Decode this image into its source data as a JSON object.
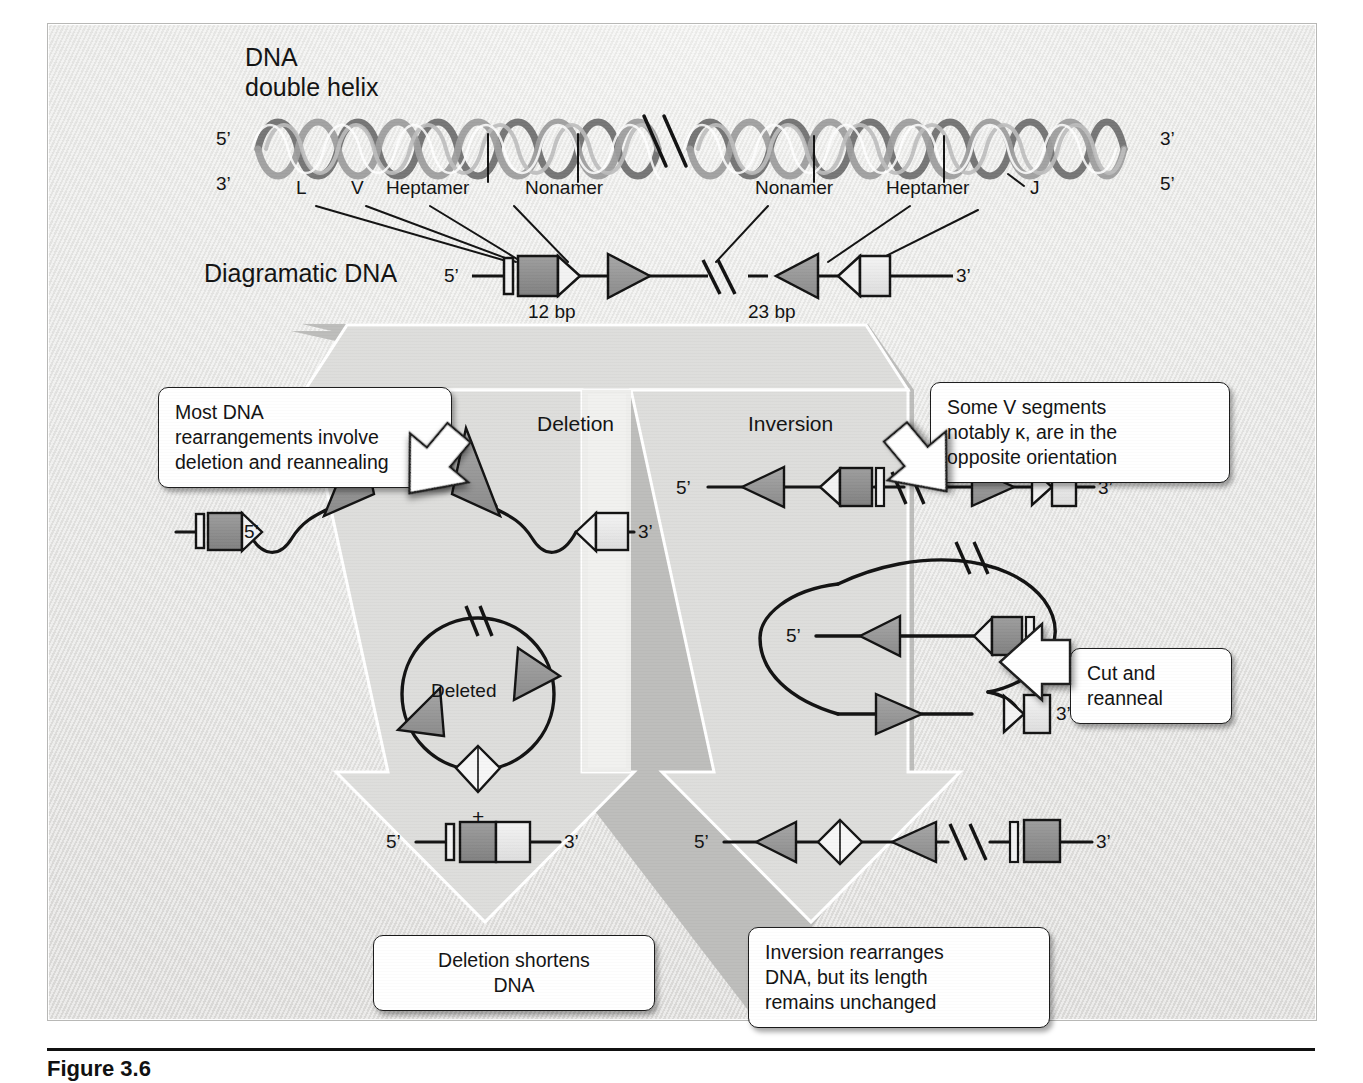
{
  "figure": {
    "caption": "Figure 3.6",
    "frame_label": "dna-recombination-figure"
  },
  "top_section": {
    "helix_title_line1": "DNA",
    "helix_title_line2": "double helix",
    "helix_left_top_prime": "5’",
    "helix_left_bottom_prime": "3’",
    "helix_right_top_prime": "3’",
    "helix_right_bottom_prime": "5’",
    "segment_labels": [
      "L",
      "V",
      "Heptamer",
      "Nonamer",
      "Nonamer",
      "Heptamer",
      "J"
    ],
    "diagram_row_label": "Diagramatic DNA",
    "diagram_left_prime": "5’",
    "diagram_right_prime": "3’",
    "spacer_left": "12 bp",
    "spacer_right": "23 bp"
  },
  "pathways": {
    "left_title": "Deletion",
    "right_title": "Inversion"
  },
  "callouts": {
    "most_dna": "Most DNA\nrearrangements involve\ndeletion and reannealing",
    "some_v": "Some V segments\nnotably κ, are in the\nopposite orientation",
    "cut_and_reanneal": "Cut and\nreanneal",
    "deletion_result": "Deletion shortens\nDNA",
    "inversion_result": "Inversion rearranges\nDNA, but its length\nremains unchanged"
  },
  "deletion_pathway": {
    "looped_left_prime": "5’",
    "looped_right_prime": "3’",
    "circle_label": "Deleted",
    "plus_sign": "+",
    "product_left_prime": "5’",
    "product_right_prime": "3’"
  },
  "inversion_pathway": {
    "top_left_prime": "5’",
    "top_right_prime": "3’",
    "loop_left_prime": "5’",
    "loop_right_prime": "3’",
    "product_left_prime": "5’",
    "product_right_prime": "3’"
  },
  "colors": {
    "ink": "#111111",
    "segment_fill_dark": "#8d8d8d",
    "segment_fill_mid": "#a9a9a9",
    "segment_fill_light": "#e8e8e8",
    "arrow_fill": "#f3f3f1",
    "arrow_stroke": "#ffffff",
    "panel_bg": "#b8b8b6"
  }
}
